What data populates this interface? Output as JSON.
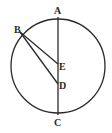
{
  "diagram": {
    "type": "geometry",
    "circle": {
      "cx": 58,
      "cy": 66,
      "r": 47
    },
    "points": {
      "A": {
        "label": "A",
        "x": 58,
        "y": 19
      },
      "B": {
        "label": "B",
        "x": 20,
        "y": 32
      },
      "C": {
        "label": "C",
        "x": 58,
        "y": 113
      },
      "D": {
        "label": "D",
        "x": 58,
        "y": 84
      },
      "E": {
        "label": "E",
        "x": 58,
        "y": 64
      }
    },
    "segments": [
      {
        "from": "A",
        "to": "C"
      },
      {
        "from": "B",
        "to": "E"
      },
      {
        "from": "B",
        "to": "D"
      }
    ],
    "colors": {
      "stroke": "#2a2a2a",
      "background": "#ffffff"
    }
  }
}
